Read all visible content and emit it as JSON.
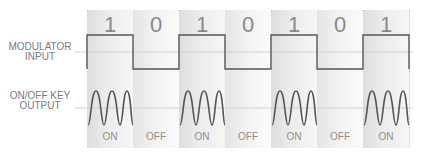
{
  "diagram": {
    "rows": {
      "input_label_line1": "MODULATOR",
      "input_label_line2": "INPUT",
      "output_label_line1": "ON/OFF KEY",
      "output_label_line2": "OUTPUT"
    },
    "bits": [
      {
        "bit": "1",
        "state": "ON"
      },
      {
        "bit": "0",
        "state": "OFF"
      },
      {
        "bit": "1",
        "state": "ON"
      },
      {
        "bit": "0",
        "state": "OFF"
      },
      {
        "bit": "1",
        "state": "ON"
      },
      {
        "bit": "0",
        "state": "OFF"
      },
      {
        "bit": "1",
        "state": "ON"
      }
    ],
    "colors": {
      "signal": "#555555",
      "axis": "#c8c8c8",
      "text": "#8a8a8a"
    }
  }
}
